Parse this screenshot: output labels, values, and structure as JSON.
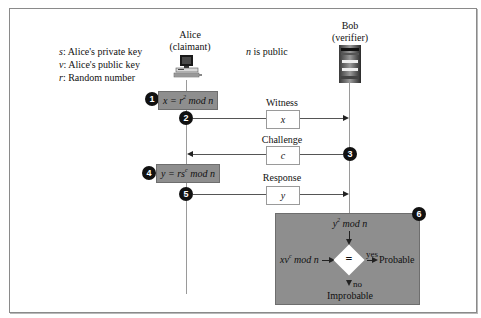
{
  "diagram": {
    "type": "sequence-protocol"
  },
  "legend": {
    "items": [
      {
        "symbol": "s",
        "text": ": Alice's private key"
      },
      {
        "symbol": "v",
        "text": ": Alice's public key"
      },
      {
        "symbol": "r",
        "text": ": Random number"
      }
    ]
  },
  "public_note": {
    "symbol": "n",
    "text": " is public"
  },
  "actors": {
    "alice": {
      "name": "Alice",
      "role": "(claimant)",
      "icon": "computer-icon"
    },
    "bob": {
      "name": "Bob",
      "role": "(verifier)",
      "icon": "server-icon"
    }
  },
  "steps": [
    {
      "num": "1",
      "label": "x = r² mod n",
      "parts": {
        "pre": "x = r",
        "sup": "2",
        "post": " mod n"
      }
    },
    {
      "num": "2",
      "message": "Witness",
      "value": "x",
      "direction": "alice-to-bob"
    },
    {
      "num": "3",
      "message": "Challenge",
      "value": "c",
      "direction": "bob-to-alice"
    },
    {
      "num": "4",
      "label": "y = rs^c mod n",
      "parts": {
        "pre": "y = rs",
        "sup": "c",
        "post": " mod n"
      }
    },
    {
      "num": "5",
      "message": "Response",
      "value": "y",
      "direction": "alice-to-bob"
    },
    {
      "num": "6",
      "label": "verification"
    }
  ],
  "verification": {
    "top_input": {
      "pre": "y",
      "sup": "2",
      "post": " mod n"
    },
    "left_input": {
      "pre": "xv",
      "sup": "c",
      "post": " mod n"
    },
    "operator": "=",
    "yes_label": "yes",
    "yes_result": "Probable",
    "no_label": "no",
    "no_result": "Improbable"
  },
  "colors": {
    "gray_box": "#8e8e8e",
    "badge": "#111111",
    "lifeline": "#9a9a9a",
    "frame_border": "#8a8a8a"
  }
}
